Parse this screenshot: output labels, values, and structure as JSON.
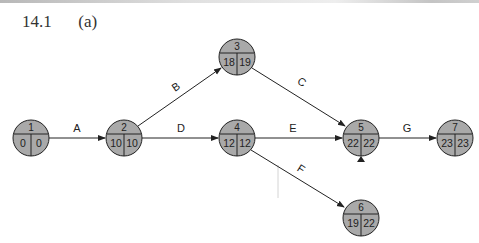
{
  "heading": {
    "number": "14.1",
    "part": "(a)"
  },
  "diagram": {
    "node_fill": "#a9a9a9",
    "line_color": "#222222",
    "nodes": [
      {
        "id": "1",
        "es": "0",
        "ls": "0",
        "cx": 31,
        "cy": 138
      },
      {
        "id": "2",
        "es": "10",
        "ls": "10",
        "cx": 124,
        "cy": 138
      },
      {
        "id": "3",
        "es": "18",
        "ls": "19",
        "cx": 237,
        "cy": 57
      },
      {
        "id": "4",
        "es": "12",
        "ls": "12",
        "cx": 237,
        "cy": 138
      },
      {
        "id": "5",
        "es": "22",
        "ls": "22",
        "cx": 361,
        "cy": 138
      },
      {
        "id": "6",
        "es": "19",
        "ls": "22",
        "cx": 361,
        "cy": 218
      },
      {
        "id": "7",
        "es": "23",
        "ls": "23",
        "cx": 455,
        "cy": 138
      }
    ],
    "edges": [
      {
        "label": "A",
        "from": "1",
        "to": "2"
      },
      {
        "label": "B",
        "from": "2",
        "to": "3"
      },
      {
        "label": "C",
        "from": "3",
        "to": "5"
      },
      {
        "label": "D",
        "from": "2",
        "to": "4"
      },
      {
        "label": "E",
        "from": "4",
        "to": "5"
      },
      {
        "label": "F",
        "from": "4",
        "to": "6"
      },
      {
        "label": "G",
        "from": "5",
        "to": "7"
      }
    ]
  }
}
